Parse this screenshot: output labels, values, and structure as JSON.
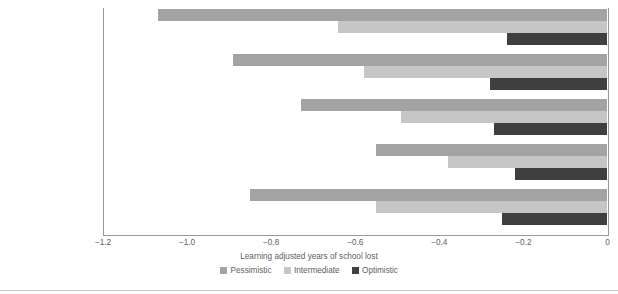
{
  "chart_data": {
    "type": "bar",
    "orientation": "horizontal",
    "title": "",
    "subtitle": "",
    "xlabel": "Learning adjusted years of school lost",
    "ylabel": "",
    "categories": [
      "High income",
      "Upper-middle income",
      "Lower-middle income",
      "Low income",
      "Global"
    ],
    "series": [
      {
        "name": "Pessimistic",
        "color": "#a3a3a3",
        "values": [
          -1.07,
          -0.89,
          -0.73,
          -0.55,
          -0.85
        ]
      },
      {
        "name": "Intermediate",
        "color": "#c6c6c6",
        "values": [
          -0.64,
          -0.58,
          -0.49,
          -0.38,
          -0.55
        ]
      },
      {
        "name": "Optimistic",
        "color": "#3f3f3f",
        "values": [
          -0.24,
          -0.28,
          -0.27,
          -0.22,
          -0.25
        ]
      }
    ],
    "xlim": [
      -1.2,
      0
    ],
    "xticks": [
      -1.2,
      -1.0,
      -0.8,
      -0.6,
      -0.4,
      -0.2,
      0
    ],
    "xtick_labels": [
      "−1.2",
      "−1.0",
      "−0.8",
      "−0.6",
      "−0.4",
      "−0.2",
      "0"
    ],
    "grid": false,
    "legend_position": "bottom-center",
    "legend_entries": [
      "Pessimistic",
      "Intermediate",
      "Optimistic"
    ]
  }
}
